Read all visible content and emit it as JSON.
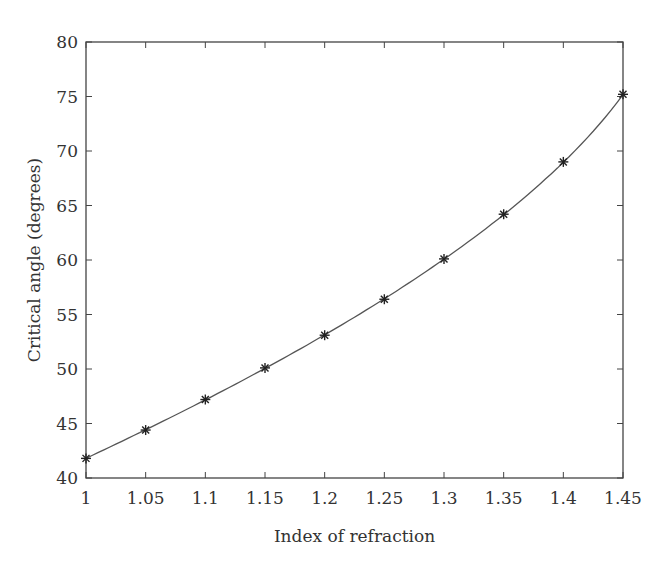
{
  "chart_data": {
    "type": "line",
    "title": "",
    "xlabel": "Index of refraction",
    "ylabel": "Critical angle (degrees)",
    "x": [
      1.0,
      1.05,
      1.1,
      1.15,
      1.2,
      1.25,
      1.3,
      1.35,
      1.4,
      1.45
    ],
    "series": [
      {
        "name": "Critical angle",
        "marker": "asterisk",
        "values": [
          41.8,
          44.4,
          47.2,
          50.1,
          53.1,
          56.4,
          60.1,
          64.2,
          69.0,
          75.2
        ]
      }
    ],
    "xlim": [
      1.0,
      1.45
    ],
    "ylim": [
      40,
      80
    ],
    "xticks": [
      "1",
      "1.05",
      "1.1",
      "1.15",
      "1.2",
      "1.25",
      "1.3",
      "1.35",
      "1.4",
      "1.45"
    ],
    "yticks": [
      "40",
      "45",
      "50",
      "55",
      "60",
      "65",
      "70",
      "75",
      "80"
    ],
    "grid": false,
    "legend": null,
    "line_color": "#555555"
  }
}
